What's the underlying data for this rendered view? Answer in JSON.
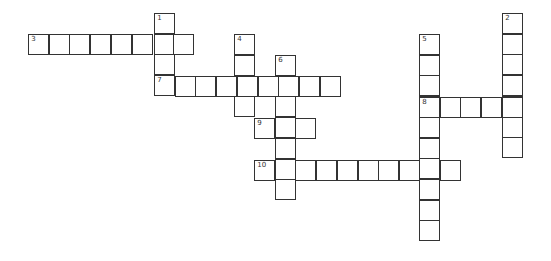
{
  "puzzle": {
    "type": "crossword",
    "cell_size_px": 21,
    "colors": {
      "line": "#333333",
      "cell": "#ffffff",
      "background": "#ffffff"
    },
    "entries": [
      {
        "number": "1",
        "direction": "down",
        "x": 155,
        "y": 14,
        "length": 4
      },
      {
        "number": "2",
        "direction": "down",
        "x": 503,
        "y": 14,
        "length": 7
      },
      {
        "number": "3",
        "direction": "across",
        "x": 29,
        "y": 35,
        "length": 8
      },
      {
        "number": "4",
        "direction": "down",
        "x": 235,
        "y": 35,
        "length": 4
      },
      {
        "number": "5",
        "direction": "down",
        "x": 420,
        "y": 35,
        "length": 10
      },
      {
        "number": "6",
        "direction": "down",
        "x": 276,
        "y": 56,
        "length": 7
      },
      {
        "number": "7",
        "direction": "across",
        "x": 155,
        "y": 77,
        "length": 9
      },
      {
        "number": "8",
        "direction": "across",
        "x": 420,
        "y": 98,
        "length": 5
      },
      {
        "number": "9",
        "direction": "across",
        "x": 255,
        "y": 119,
        "length": 3
      },
      {
        "number": "10",
        "direction": "across",
        "x": 255,
        "y": 161,
        "length": 10
      }
    ]
  }
}
